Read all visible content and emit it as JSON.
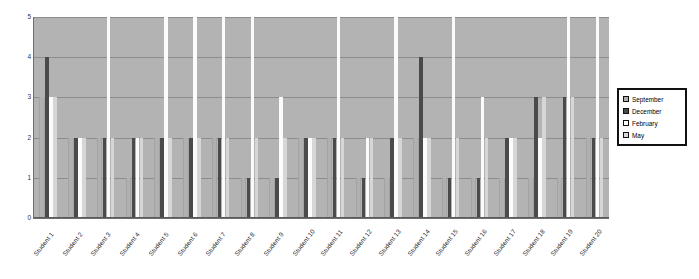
{
  "chart_data": {
    "type": "bar",
    "title": "",
    "xlabel": "",
    "ylabel": "",
    "ylim": [
      0,
      5
    ],
    "yticks": [
      0,
      1,
      2,
      3,
      4,
      5
    ],
    "grid": true,
    "legend_position": "right",
    "categories": [
      "Student 1",
      "Student 2",
      "Student 3",
      "Student 4",
      "Student 5",
      "Student 6",
      "Student 7",
      "Student 8",
      "Student 9",
      "Student 10",
      "Student 11",
      "Student 12",
      "Student 13",
      "Student 14",
      "Student 15",
      "Student 16",
      "Student 17",
      "Student 18",
      "Student 19",
      "Student 20"
    ],
    "series": [
      {
        "name": "September",
        "color": "#b0b0b0",
        "values": [
          3,
          2,
          2,
          1,
          2,
          2,
          2,
          1,
          1,
          2,
          2,
          1,
          1,
          2,
          1,
          1,
          1,
          1,
          1,
          2
        ]
      },
      {
        "name": "December",
        "color": "#4a4a4a",
        "values": [
          4,
          2,
          2,
          2,
          2,
          2,
          2,
          1,
          1,
          2,
          2,
          1,
          2,
          4,
          1,
          1,
          2,
          3,
          3,
          2
        ]
      },
      {
        "name": "February",
        "color": "#ffffff",
        "values": [
          3,
          2,
          5,
          2,
          5,
          5,
          5,
          5,
          3,
          2,
          5,
          2,
          5,
          2,
          5,
          3,
          2,
          2,
          5,
          5
        ]
      },
      {
        "name": "May",
        "color": "#d8d8d8",
        "values": [
          3,
          2,
          2,
          2,
          2,
          2,
          2,
          2,
          2,
          2,
          2,
          2,
          2,
          2,
          2,
          2,
          2,
          3,
          3,
          2
        ]
      }
    ]
  },
  "legend": {
    "items": [
      {
        "label": "September",
        "swatch": "swatch-september"
      },
      {
        "label": "December",
        "swatch": "swatch-december"
      },
      {
        "label": "February",
        "swatch": "swatch-february"
      },
      {
        "label": "May",
        "swatch": "swatch-may"
      }
    ]
  }
}
